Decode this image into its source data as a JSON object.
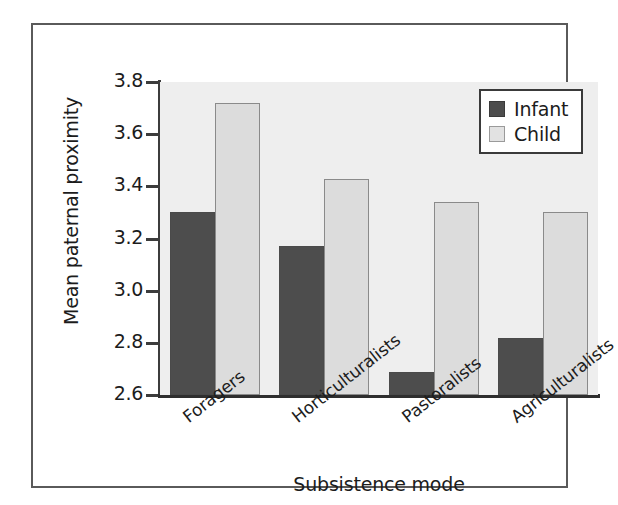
{
  "chart_data": {
    "type": "bar",
    "title": "",
    "xlabel": "Subsistence mode",
    "ylabel": "Mean paternal proximity",
    "categories": [
      "Foragers",
      "Horticulturalists",
      "Pastoralists",
      "Agriculturalists"
    ],
    "series": [
      {
        "name": "Infant",
        "color": "#4d4d4d",
        "values": [
          3.3,
          3.17,
          2.69,
          2.82
        ]
      },
      {
        "name": "Child",
        "color": "#dcdcdc",
        "values": [
          3.72,
          3.43,
          3.34,
          3.3
        ]
      }
    ],
    "ylim": [
      2.6,
      3.8
    ],
    "yticks": [
      "2.6",
      "2.8",
      "3.0",
      "3.2",
      "3.4",
      "3.6",
      "3.8"
    ],
    "ytick_values": [
      2.6,
      2.8,
      3.0,
      3.2,
      3.4,
      3.6,
      3.8
    ],
    "grid": false,
    "legend_position": "top-right",
    "plot_background": "#eeeeee",
    "frame_color": "#5a5a5a"
  },
  "legend": {
    "items": [
      {
        "label": "Infant"
      },
      {
        "label": "Child"
      }
    ]
  },
  "axes": {
    "ylabel": "Mean paternal proximity",
    "xlabel": "Subsistence mode"
  }
}
